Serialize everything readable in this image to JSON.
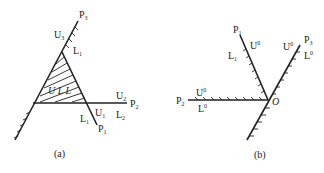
{
  "figure_a": {
    "caption": "(a)",
    "labels": {
      "P3": {
        "base": "P",
        "sub": "3"
      },
      "U3": {
        "base": "U",
        "sub": "3"
      },
      "L1_top": {
        "base": "L",
        "sub": "1"
      },
      "inner": "U L L",
      "U2": {
        "base": "U",
        "sub": "2"
      },
      "P2": {
        "base": "P",
        "sub": "2"
      },
      "U1": {
        "base": "U",
        "sub": "1"
      },
      "L2": {
        "base": "L",
        "sub": "2"
      },
      "L1_bottom": {
        "base": "L",
        "sub": "1"
      },
      "P1": {
        "base": "P",
        "sub": "1"
      }
    }
  },
  "figure_b": {
    "caption": "(b)",
    "origin": "O",
    "labels": {
      "P1": {
        "base": "P",
        "sub": "1"
      },
      "U1": {
        "base": "U",
        "sub": "1",
        "sup": "0"
      },
      "L1": {
        "base": "L",
        "sub": "1"
      },
      "U3": {
        "base": "U",
        "sub": "3",
        "sup": "0"
      },
      "P3": {
        "base": "P",
        "sub": "3"
      },
      "L3": {
        "base": "L",
        "sub": "3",
        "sup": "0"
      },
      "P2": {
        "base": "P",
        "sub": "2"
      },
      "U2": {
        "base": "U",
        "sub": "2",
        "sup": "0"
      },
      "L2": {
        "base": "L",
        "sub": "2",
        "sup": "0"
      }
    }
  }
}
